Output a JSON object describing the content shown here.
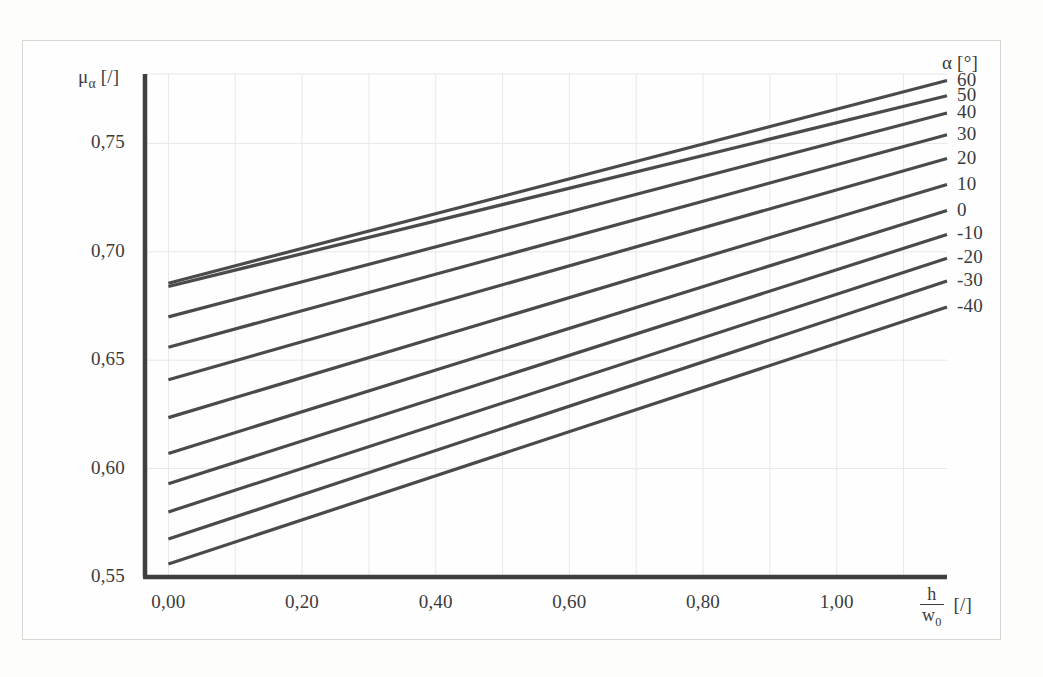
{
  "figure": {
    "background": "#fdfdfc",
    "frame_color": "#d8d6d2",
    "line_color": "#4a4a4a",
    "text_color": "#3b3b3b",
    "grid_color": "#e9e7e3"
  },
  "axes": {
    "y_title_mu": "μ",
    "y_title_sub": "α",
    "y_title_unit": "[/]",
    "x_title_num": "h",
    "x_title_den": "w",
    "x_title_den_sub": "0",
    "x_title_unit": "[/]",
    "legend_title": "α [°]"
  },
  "chart_data": {
    "type": "line",
    "title": "",
    "xlabel": "h/w0 [/]",
    "ylabel": "mu_alpha [/]",
    "xlim": [
      -0.035,
      1.165
    ],
    "ylim": [
      0.55,
      0.782
    ],
    "xticks": [
      0.0,
      0.2,
      0.4,
      0.6,
      0.8,
      1.0
    ],
    "xticklabels": [
      "0,00",
      "0,20",
      "0,40",
      "0,60",
      "0,80",
      "1,00"
    ],
    "yticks": [
      0.55,
      0.6,
      0.65,
      0.7,
      0.75
    ],
    "yticklabels": [
      "0,55",
      "0,60",
      "0,65",
      "0,70",
      "0,75"
    ],
    "grid": true,
    "legend_position": "right",
    "legend_unit": "°",
    "x": [
      0.0,
      1.165
    ],
    "series": [
      {
        "name": "60",
        "label": "60",
        "values": [
          0.6855,
          0.779
        ]
      },
      {
        "name": "50",
        "label": "50",
        "values": [
          0.684,
          0.772
        ]
      },
      {
        "name": "40",
        "label": "40",
        "values": [
          0.67,
          0.764
        ]
      },
      {
        "name": "30",
        "label": "30",
        "values": [
          0.656,
          0.754
        ]
      },
      {
        "name": "20",
        "label": "20",
        "values": [
          0.641,
          0.743
        ]
      },
      {
        "name": "10",
        "label": "10",
        "values": [
          0.6235,
          0.731
        ]
      },
      {
        "name": "0",
        "label": "0",
        "values": [
          0.607,
          0.719
        ]
      },
      {
        "name": "-10",
        "label": "-10",
        "values": [
          0.593,
          0.708
        ]
      },
      {
        "name": "-20",
        "label": "-20",
        "values": [
          0.58,
          0.697
        ]
      },
      {
        "name": "-30",
        "label": "-30",
        "values": [
          0.5675,
          0.6865
        ]
      },
      {
        "name": "-40",
        "label": "-40",
        "values": [
          0.556,
          0.6745
        ]
      }
    ]
  }
}
